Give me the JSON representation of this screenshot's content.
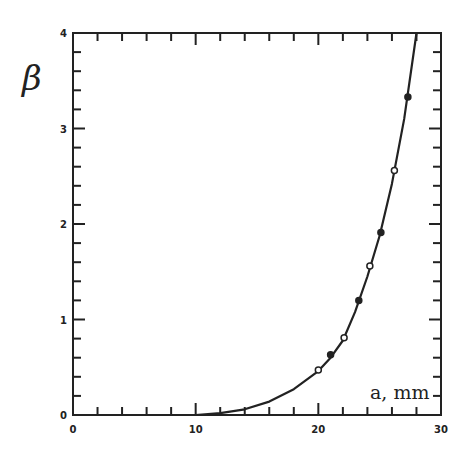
{
  "chart_data": {
    "type": "scatter",
    "title": "",
    "xlabel": "a, mm",
    "ylabel": "β",
    "xlim": [
      0,
      30
    ],
    "ylim": [
      0,
      4
    ],
    "x_ticks": [
      0,
      10,
      20,
      30
    ],
    "x_tick_labels": [
      "0",
      "10",
      "20",
      "30"
    ],
    "y_ticks": [
      0,
      1,
      2,
      3,
      4
    ],
    "y_tick_labels": [
      "0",
      "1",
      "2",
      "3",
      "4"
    ],
    "grid": false,
    "legend": null,
    "series": [
      {
        "name": "measured",
        "kind": "markers",
        "x": [
          20.0,
          21.0,
          22.1,
          23.3,
          24.2,
          25.1,
          26.2,
          27.3
        ],
        "y": [
          0.47,
          0.63,
          0.81,
          1.2,
          1.56,
          1.91,
          2.56,
          3.33
        ]
      },
      {
        "name": "fit",
        "kind": "line",
        "x": [
          10,
          12,
          14,
          16,
          18,
          20,
          21,
          22,
          23,
          24,
          25,
          26,
          27,
          28
        ],
        "y": [
          0.0,
          0.02,
          0.06,
          0.14,
          0.27,
          0.46,
          0.6,
          0.78,
          1.08,
          1.45,
          1.88,
          2.42,
          3.1,
          4.0
        ]
      }
    ]
  },
  "labels": {
    "ylabel": "β",
    "xlabel": "a, mm"
  }
}
